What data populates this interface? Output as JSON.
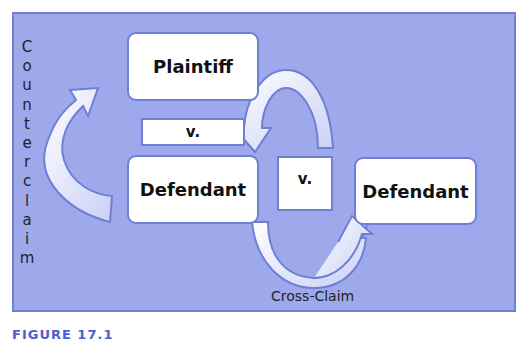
{
  "diagram": {
    "nodes": {
      "plaintiff": "Plaintiff",
      "v_left": "v.",
      "defendant_left": "Defendant",
      "v_middle": "v.",
      "defendant_right": "Defendant"
    },
    "labels": {
      "counterclaim_letters": [
        "C",
        "o",
        "u",
        "n",
        "t",
        "e",
        "r",
        "c",
        "l",
        "a",
        "i",
        "m"
      ],
      "cross_claim": "Cross-Claim"
    },
    "caption": "FIGURE 17.1",
    "colors": {
      "background": "#9ea9ec",
      "border": "#6f7fd6",
      "box_fill": "#ffffff",
      "arrow_fill": "#e3e7fb",
      "caption": "#4a5fd0"
    }
  }
}
